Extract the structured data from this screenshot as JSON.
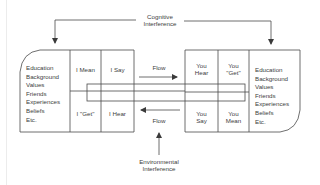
{
  "top_label": {
    "line1": "Cognitive",
    "line2": "Interference"
  },
  "bottom_label": {
    "line1": "Environmental",
    "line2": "Interference"
  },
  "sender": {
    "background_list": [
      "Education",
      "Background",
      "Values",
      "Friends",
      "Experiences",
      "Beliefs",
      "Etc."
    ],
    "cells": {
      "top_1": "I Mean",
      "top_2": "I Say",
      "bottom_1": "I \"Get\"",
      "bottom_2": "I Hear"
    }
  },
  "receiver": {
    "background_list": [
      "Education",
      "Background",
      "Values",
      "Friends",
      "Experiences",
      "Beliefs",
      "Etc."
    ],
    "cells": {
      "top_1": "You",
      "top_1b": "Hear",
      "top_2": "You",
      "top_2b": "\"Get\"",
      "bottom_1": "You",
      "bottom_1b": "Say",
      "bottom_2": "You",
      "bottom_2b": "Mean"
    }
  },
  "flows": {
    "forward": "Flow",
    "backward": "Flow"
  },
  "colors": {
    "line": "#4a4a4a",
    "text": "#3d3d3d",
    "background": "#ffffff"
  }
}
